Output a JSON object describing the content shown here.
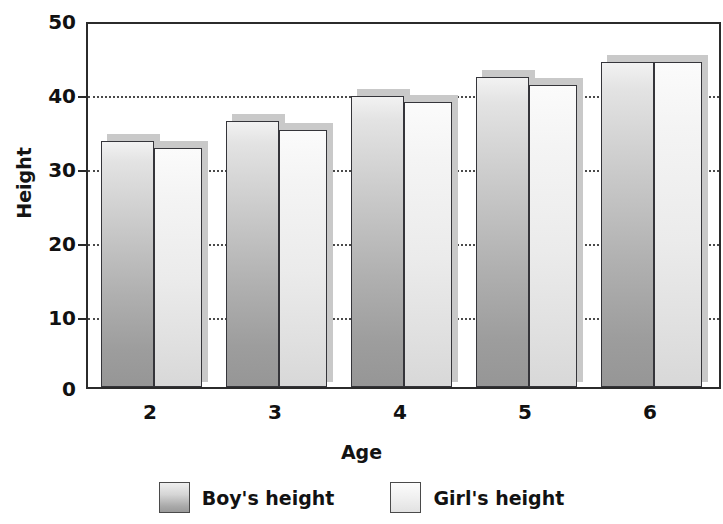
{
  "chart_data": {
    "type": "bar",
    "title": "",
    "xlabel": "Age",
    "ylabel": "Height",
    "categories": [
      "2",
      "3",
      "4",
      "5",
      "6"
    ],
    "series": [
      {
        "name": "Boy's height",
        "values": [
          33.5,
          36.2,
          39.6,
          42.3,
          44.3
        ]
      },
      {
        "name": "Girl's height",
        "values": [
          32.6,
          35.0,
          38.8,
          41.2,
          44.3
        ]
      }
    ],
    "ylim": [
      0,
      50
    ],
    "yticks": [
      0,
      10,
      20,
      30,
      40,
      50
    ],
    "ytick_labels": [
      "0",
      "10",
      "20",
      "30",
      "40",
      "50"
    ],
    "grid": true,
    "grid_style": "dotted-horizontal",
    "legend_position": "bottom-center",
    "colors": {
      "boy_fill_top": "#f2f2f2",
      "boy_fill_bottom": "#969696",
      "girl_fill_top": "#fbfbfb",
      "girl_fill_bottom": "#d8d8d8",
      "bar_border": "#35353a",
      "axis": "#2b2b2b",
      "gridline": "#4a4a4a",
      "text": "#111111",
      "background": "#ffffff"
    }
  },
  "axes": {
    "y_title": "Height",
    "x_title": "Age",
    "y_tick_labels": [
      "50",
      "40",
      "30",
      "20",
      "10",
      "0"
    ],
    "x_tick_labels": [
      "2",
      "3",
      "4",
      "5",
      "6"
    ]
  },
  "legend": {
    "items": [
      {
        "label": "Boy's height",
        "swatch": "boy-swatch-icon"
      },
      {
        "label": "Girl's height",
        "swatch": "girl-swatch-icon"
      }
    ]
  }
}
